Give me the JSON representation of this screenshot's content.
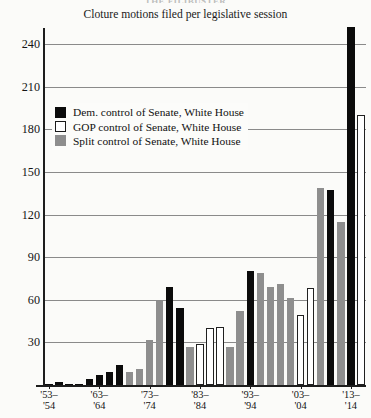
{
  "header": {
    "clipped_title": "THE FILIBUSTER",
    "subtitle": "Cloture motions filed per legislative session"
  },
  "legend": {
    "position": "inside-top-left",
    "items": [
      {
        "key": "dem",
        "swatch": "black-square-icon",
        "label": "Dem. control of Senate, White House",
        "color": "#0b0b0b"
      },
      {
        "key": "gop",
        "swatch": "white-square-icon",
        "label": "GOP control of Senate, White House",
        "color": "#ffffff"
      },
      {
        "key": "split",
        "swatch": "gray-square-icon",
        "label": "Split control of Senate, White House",
        "color": "#8e8e8e"
      }
    ]
  },
  "axes": {
    "y_ticks": [
      30,
      60,
      90,
      120,
      150,
      180,
      210,
      240
    ],
    "y_min": 0,
    "y_max": 255,
    "x_tick_labels": [
      {
        "top": "'53–",
        "bottom": "'54"
      },
      {
        "top": "'63–",
        "bottom": "'64"
      },
      {
        "top": "'73–",
        "bottom": "'74"
      },
      {
        "top": "'83–",
        "bottom": "'84"
      },
      {
        "top": "'93–",
        "bottom": "'94"
      },
      {
        "top": "'03–",
        "bottom": "'04"
      },
      {
        "top": "'13–",
        "bottom": "'14"
      }
    ]
  },
  "chart_data": {
    "type": "bar",
    "title": "Cloture motions filed per legislative session",
    "xlabel": "",
    "ylabel": "",
    "ylim": [
      0,
      255
    ],
    "grid": true,
    "legend_position": "inside-top-left",
    "categories": [
      "'53–'54",
      "'55–'56",
      "'57–'58",
      "'59–'60",
      "'61–'62",
      "'63–'64",
      "'65–'66",
      "'67–'68",
      "'69–'70",
      "'71–'72",
      "'73–'74",
      "'75–'76",
      "'77–'78",
      "'79–'80",
      "'81–'82",
      "'83–'84",
      "'85–'86",
      "'87–'88",
      "'89–'90",
      "'91–'92",
      "'93–'94",
      "'95–'96",
      "'97–'98",
      "'99–'00",
      "'01–'02",
      "'03–'04",
      "'05–'06",
      "'07–'08",
      "'09–'10",
      "'11–'12",
      "'13–'14"
    ],
    "values": [
      1,
      2,
      0,
      1,
      4,
      7,
      9,
      14,
      9,
      11,
      32,
      59,
      69,
      54,
      27,
      29,
      40,
      41,
      27,
      52,
      80,
      79,
      69,
      71,
      61,
      49,
      68,
      139,
      137,
      115,
      252
    ],
    "control": [
      "dem",
      "dem",
      "dem",
      "dem",
      "dem",
      "dem",
      "dem",
      "dem",
      "split",
      "split",
      "split",
      "split",
      "dem",
      "dem",
      "split",
      "gop",
      "gop",
      "gop",
      "split",
      "split",
      "dem",
      "split",
      "split",
      "split",
      "split",
      "gop",
      "gop",
      "split",
      "dem",
      "split",
      "dem"
    ],
    "series": [
      {
        "name": "Dem. control of Senate, White House",
        "color": "#0b0b0b"
      },
      {
        "name": "GOP control of Senate, White House",
        "color": "#ffffff"
      },
      {
        "name": "Split control of Senate, White House",
        "color": "#8e8e8e"
      }
    ],
    "extra_bars": [
      {
        "category": "'13–'14 (second)",
        "value": 190,
        "control": "gop"
      }
    ]
  }
}
